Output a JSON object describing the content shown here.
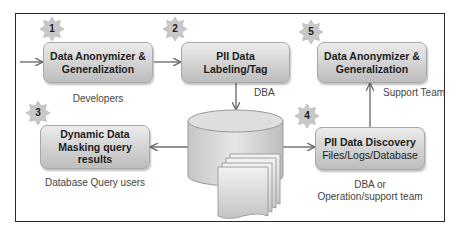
{
  "diagram": {
    "steps": [
      {
        "number": "1",
        "lines": [
          "Data Anonymizer &",
          "Generalization"
        ],
        "role": "Developers"
      },
      {
        "number": "2",
        "lines": [
          "PII Data",
          "Labeling/Tag"
        ],
        "role": "DBA"
      },
      {
        "number": "3",
        "lines": [
          "Dynamic Data",
          "Masking query",
          "results"
        ],
        "role": "Database Query users"
      },
      {
        "number": "4",
        "lines": [
          "PII Data Discovery",
          "Files/Logs/Database"
        ],
        "role_lines": [
          "DBA or",
          "Operation/support team"
        ]
      },
      {
        "number": "5",
        "lines": [
          "Data Anonymizer &",
          "Generalization"
        ],
        "role": "Support Team"
      }
    ],
    "central_store": {
      "shapes": [
        "database-cylinder",
        "document-stack"
      ]
    },
    "colors": {
      "box_fill_top": "#ececec",
      "box_fill_bottom": "#bdbdbd",
      "badge_fill": "#c8c8c8",
      "arrow": "#6e6e6e",
      "frame": "#2a2a2a",
      "text": "#1e1e1e"
    },
    "flows": [
      {
        "from": "external",
        "to": "1"
      },
      {
        "from": "1",
        "to": "2"
      },
      {
        "from": "2",
        "to": "central_store"
      },
      {
        "from": "central_store",
        "to": "3"
      },
      {
        "from": "central_store",
        "to": "4"
      },
      {
        "from": "4",
        "to": "5"
      }
    ]
  }
}
